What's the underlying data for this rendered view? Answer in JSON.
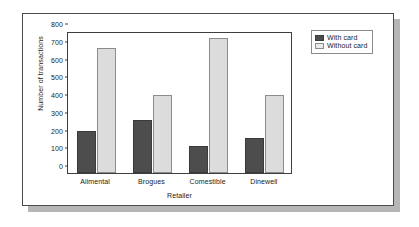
{
  "chart_data": {
    "type": "bar",
    "title": "",
    "xlabel": "Retailer",
    "ylabel": "Number of transactions",
    "categories": [
      "Alimental",
      "Brogues",
      "Comestible",
      "Dinewell"
    ],
    "series": [
      {
        "name": "With card",
        "color": "#4d4d4d",
        "values": [
          235,
          300,
          150,
          198
        ]
      },
      {
        "name": "Without card",
        "color": "#dcdcdc",
        "values": [
          705,
          440,
          762,
          442
        ]
      }
    ],
    "ylim": [
      0,
      800
    ],
    "yticks": [
      0,
      100,
      200,
      300,
      400,
      500,
      600,
      700,
      800
    ],
    "ytick_labels": [
      "0",
      "100",
      "200",
      "300",
      "400",
      "500",
      "600",
      "700",
      "800"
    ],
    "grid": false,
    "legend_position": "top-right-outside"
  },
  "legend": {
    "items": [
      {
        "label": "With card"
      },
      {
        "label": "Without card"
      }
    ]
  }
}
